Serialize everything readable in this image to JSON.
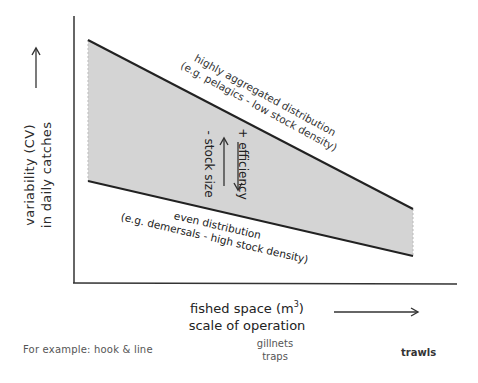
{
  "diagram": {
    "y_axis": {
      "label_line1": "variability  (CV)",
      "label_line2": "in  daily catches",
      "direction_icon": "arrow-up"
    },
    "x_axis": {
      "label_line1": "fished space (m",
      "label_sup": "3",
      "label_line1_end": ")",
      "label_line2": "scale of operation",
      "direction_icon": "arrow-right"
    },
    "band": {
      "fill_color": "#d4d4d4",
      "upper_edge": {
        "label_line1": "highly aggregated distribution",
        "label_line2": "(e.g. pelagics - low stock density)"
      },
      "lower_edge": {
        "label_line1": "even distribution",
        "label_line2": "(e.g. demersals - high stock density)"
      },
      "inner_annotations": {
        "stock_size": "- stock size",
        "stock_size_arrow": "arrow-up",
        "efficiency": "+ efficiency",
        "efficiency_arrow": "arrow-down"
      }
    },
    "examples": {
      "left": "For example: hook & line",
      "middle_line1": "gillnets",
      "middle_line2": "traps",
      "right": "trawls"
    }
  }
}
